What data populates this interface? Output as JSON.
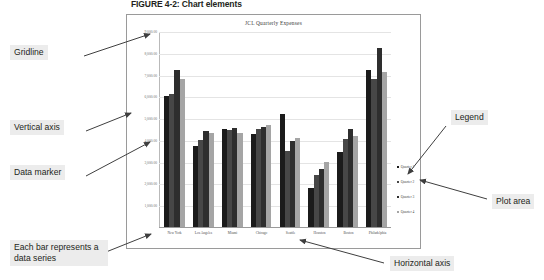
{
  "figure": {
    "caption": "FIGURE 4-2: Chart elements"
  },
  "annotations": {
    "gridline": "Gridline",
    "vertical_axis": "Vertical axis",
    "data_marker": "Data marker",
    "data_series": "Each bar represents a data series",
    "legend": "Legend",
    "plot_area": "Plot area",
    "horizontal_axis": "Horizontal axis"
  },
  "colors": {
    "quarter1": "#1b1b1b",
    "quarter2": "#474747",
    "quarter3": "#2e2e2e",
    "quarter4": "#a5a5a5",
    "gridline": "#e4e4e4",
    "axis": "#9a9a9a",
    "annotation_background": "#ececec",
    "chart_border": "#9a9a9a"
  },
  "chart_data": {
    "type": "bar",
    "title": "JCL Quarterly Expenses",
    "xlabel": "",
    "ylabel": "",
    "ylim": [
      0,
      9000
    ],
    "ytick_values": [
      1000,
      2000,
      3000,
      4000,
      5000,
      6000,
      7000,
      8000,
      9000
    ],
    "ytick_labels": [
      "1,000.00",
      "2,000.00",
      "3,000.00",
      "4,000.00",
      "5,000.00",
      "6,000.00",
      "7,000.00",
      "8,000.00",
      "9,000.00"
    ],
    "grid": true,
    "legend_position": "right",
    "categories": [
      "New York",
      "Los Angeles",
      "Miami",
      "Chicago",
      "Seattle",
      "Houston",
      "Boston",
      "Philadelphia"
    ],
    "series": [
      {
        "name": "Quarter 1",
        "values": [
          6000,
          3700,
          4500,
          4250,
          5200,
          1800,
          3450,
          7200
        ]
      },
      {
        "name": "Quarter 2",
        "values": [
          6100,
          4000,
          4450,
          4500,
          3500,
          2400,
          4050,
          6800
        ]
      },
      {
        "name": "Quarter 3",
        "values": [
          7200,
          4400,
          4550,
          4600,
          3950,
          2650,
          4500,
          8200
        ]
      },
      {
        "name": "Quarter 4",
        "values": [
          6800,
          4300,
          4300,
          4700,
          4100,
          3000,
          4200,
          7100
        ]
      }
    ]
  }
}
